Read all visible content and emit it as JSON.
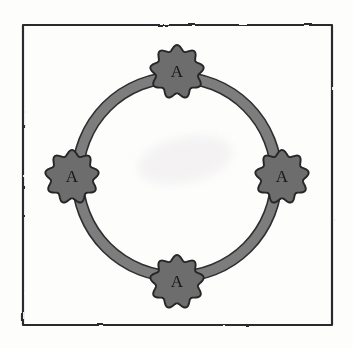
{
  "figure": {
    "kind": "hand-drawn-diagram",
    "background_color": "#fdfdfc",
    "canvas": {
      "width": 353,
      "height": 348
    }
  },
  "frame": {
    "name": "border-frame",
    "stroke_color": "#2b2b2d",
    "stroke_width": 2.2,
    "x": 23,
    "y": 25,
    "width": 309,
    "height": 300
  },
  "ring": {
    "name": "ring-link",
    "center_x": 177,
    "center_y": 177,
    "outer_radius": 105,
    "band_width": 11,
    "fill_color": "#7d7d7d",
    "stroke_color": "#2f2f31",
    "stroke_width": 1.6
  },
  "nodes": [
    {
      "id": "node-top",
      "label": "A",
      "position": "top",
      "center_x": 177,
      "center_y": 72,
      "radius": 27,
      "lobes": 9,
      "fill_color": "#6d6d6d",
      "stroke_color": "#252527",
      "label_font_size": 17
    },
    {
      "id": "node-right",
      "label": "A",
      "position": "right",
      "center_x": 282,
      "center_y": 177,
      "radius": 27,
      "lobes": 9,
      "fill_color": "#6d6d6d",
      "stroke_color": "#252527",
      "label_font_size": 17
    },
    {
      "id": "node-bottom",
      "label": "A",
      "position": "bottom",
      "center_x": 177,
      "center_y": 282,
      "radius": 27,
      "lobes": 9,
      "fill_color": "#6d6d6d",
      "stroke_color": "#252527",
      "label_font_size": 17
    },
    {
      "id": "node-left",
      "label": "A",
      "position": "left",
      "center_x": 72,
      "center_y": 177,
      "radius": 27,
      "lobes": 9,
      "fill_color": "#6d6d6d",
      "stroke_color": "#252527",
      "label_font_size": 17
    }
  ],
  "smudge": {
    "name": "paper-smudge",
    "center_x": 185,
    "center_y": 160,
    "width": 96,
    "height": 46,
    "color": "#f3f1f2"
  }
}
